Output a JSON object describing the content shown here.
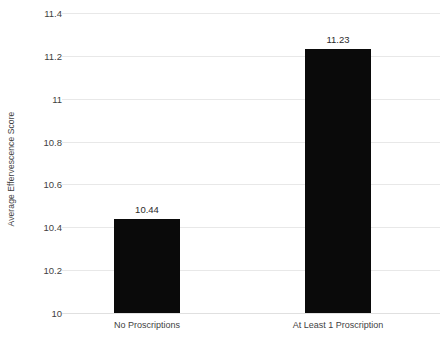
{
  "chart_data": {
    "type": "bar",
    "title": "",
    "xlabel": "",
    "ylabel": "Average Effervescence Score",
    "categories": [
      "No Proscriptions",
      "At Least 1 Proscription"
    ],
    "values": [
      10.44,
      11.23
    ],
    "value_labels": [
      "10.44",
      "11.23"
    ],
    "ylim": [
      10,
      11.4
    ],
    "ytick_values": [
      11.4,
      11.2,
      11,
      10.8,
      10.6,
      10.4,
      10.2,
      10
    ],
    "ytick_labels": [
      "11.4",
      "11.2",
      "11",
      "10.8",
      "10.6",
      "10.4",
      "10.2",
      "10"
    ],
    "grid": true,
    "legend": "none",
    "bar_color": "#0a0a0a",
    "gridline_color": "#e8e8e8",
    "background_color": "#ffffff"
  }
}
